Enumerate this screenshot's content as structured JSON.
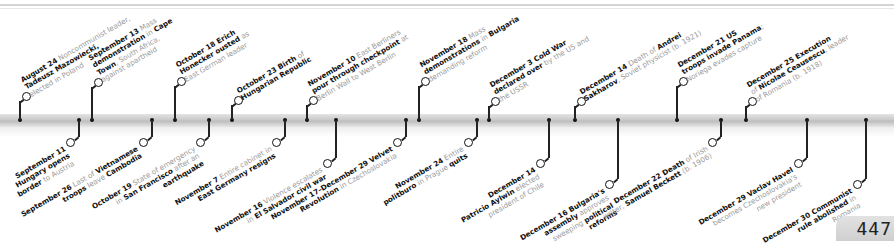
{
  "page": {
    "number": "447"
  },
  "timeline": {
    "above": [
      {
        "x": 20,
        "ringY": 93,
        "date": "August 24",
        "parts": [
          [
            "b",
            "August 24"
          ],
          [
            "t",
            " Noncommunist leader,"
          ],
          [
            "br"
          ],
          [
            "b",
            "Tadeusz Mazowiecki,"
          ],
          [
            "br"
          ],
          [
            "t",
            "elected in Poland"
          ]
        ]
      },
      {
        "x": 92,
        "ringY": 79,
        "date": "September 13",
        "parts": [
          [
            "b",
            "September 13"
          ],
          [
            "t",
            " Mass"
          ],
          [
            "br"
          ],
          [
            "b",
            "demonstration"
          ],
          [
            "t",
            " in "
          ],
          [
            "b",
            "Cape"
          ],
          [
            "br"
          ],
          [
            "b",
            "Town"
          ],
          [
            "t",
            ", South Africa,"
          ],
          [
            "br"
          ],
          [
            "t",
            "against apartheid"
          ]
        ]
      },
      {
        "x": 175,
        "ringY": 78,
        "date": "October 18",
        "parts": [
          [
            "b",
            "October 18 Erich"
          ],
          [
            "br"
          ],
          [
            "b",
            "Honecker ousted"
          ],
          [
            "t",
            " as"
          ],
          [
            "br"
          ],
          [
            "t",
            "East German leader"
          ]
        ]
      },
      {
        "x": 232,
        "ringY": 97,
        "date": "October 23",
        "parts": [
          [
            "b",
            "October 23 Birth"
          ],
          [
            "t",
            " of"
          ],
          [
            "br"
          ],
          [
            "b",
            "Hungarian Republic"
          ]
        ]
      },
      {
        "x": 307,
        "ringY": 97,
        "date": "November 10",
        "parts": [
          [
            "b",
            "November 10"
          ],
          [
            "t",
            " East Berliners"
          ],
          [
            "br"
          ],
          [
            "b",
            "pour through checkpoint"
          ],
          [
            "t",
            " at"
          ],
          [
            "br"
          ],
          [
            "t",
            "Berlin Wall to West Berlin"
          ]
        ]
      },
      {
        "x": 419,
        "ringY": 78,
        "date": "November 18",
        "parts": [
          [
            "b",
            "November 18"
          ],
          [
            "t",
            " Mass"
          ],
          [
            "br"
          ],
          [
            "b",
            "demonstrations"
          ],
          [
            "t",
            " in "
          ],
          [
            "b",
            "Bulgaria"
          ],
          [
            "br"
          ],
          [
            "t",
            "demanding reform"
          ]
        ]
      },
      {
        "x": 489,
        "ringY": 98,
        "date": "December 3",
        "parts": [
          [
            "b",
            "December 3 Cold War"
          ],
          [
            "br"
          ],
          [
            "b",
            "declared over"
          ],
          [
            "t",
            " by the US and"
          ],
          [
            "br"
          ],
          [
            "t",
            "the USSR"
          ]
        ]
      },
      {
        "x": 575,
        "ringY": 98,
        "date": "December 14",
        "parts": [
          [
            "b",
            "December 14"
          ],
          [
            "t",
            " Death of "
          ],
          [
            "b",
            "Andrei"
          ],
          [
            "br"
          ],
          [
            "b",
            "Sakharov"
          ],
          [
            "t",
            ", Soviet physicist (b. 1921)"
          ]
        ]
      },
      {
        "x": 677,
        "ringY": 78,
        "date": "December 21",
        "parts": [
          [
            "b",
            "December 21 US"
          ],
          [
            "br"
          ],
          [
            "b",
            "troops invade Panama"
          ],
          [
            "t",
            ";"
          ],
          [
            "br"
          ],
          [
            "t",
            "Noriega evades capture"
          ]
        ]
      },
      {
        "x": 746,
        "ringY": 98,
        "date": "December 25",
        "parts": [
          [
            "b",
            "December 25 Execution"
          ],
          [
            "br"
          ],
          [
            "t",
            "of "
          ],
          [
            "b",
            "Nicolae Ceausescu"
          ],
          [
            "t",
            ", leader"
          ],
          [
            "br"
          ],
          [
            "t",
            "of Romania (b. 1918)"
          ]
        ]
      }
    ],
    "below": [
      {
        "x": 79,
        "ringY": 139,
        "date": "September 11",
        "parts": [
          [
            "b",
            "September 11"
          ],
          [
            "br"
          ],
          [
            "b",
            "Hungary opens"
          ],
          [
            "br"
          ],
          [
            "b",
            "border"
          ],
          [
            "t",
            " to Austria"
          ]
        ]
      },
      {
        "x": 152,
        "ringY": 139,
        "date": "September 26",
        "parts": [
          [
            "b",
            "September 26"
          ],
          [
            "t",
            " Last of "
          ],
          [
            "b",
            "Vietnamese"
          ],
          [
            "br"
          ],
          [
            "b",
            "troops"
          ],
          [
            "t",
            " leave "
          ],
          [
            "b",
            "Cambodia"
          ]
        ]
      },
      {
        "x": 209,
        "ringY": 139,
        "date": "October 19",
        "parts": [
          [
            "b",
            "October 19"
          ],
          [
            "t",
            " State of emergency"
          ],
          [
            "br"
          ],
          [
            "t",
            "in "
          ],
          [
            "b",
            "San Francisco"
          ],
          [
            "t",
            " after an"
          ],
          [
            "br"
          ],
          [
            "b",
            "earthquake"
          ]
        ]
      },
      {
        "x": 285,
        "ringY": 139,
        "date": "November 7",
        "parts": [
          [
            "b",
            "November 7"
          ],
          [
            "t",
            " Entire cabinet in"
          ],
          [
            "br"
          ],
          [
            "b",
            "East Germany resigns"
          ]
        ]
      },
      {
        "x": 336,
        "ringY": 160,
        "date": "November 16",
        "parts": [
          [
            "b",
            "November 16"
          ],
          [
            "t",
            " Violence escalates"
          ],
          [
            "br"
          ],
          [
            "t",
            "in "
          ],
          [
            "b",
            "El Salvador civil war"
          ]
        ]
      },
      {
        "x": 406,
        "ringY": 139,
        "date": "November 17–December 29",
        "parts": [
          [
            "b",
            "November 17–December 29 Velvet"
          ],
          [
            "br"
          ],
          [
            "b",
            "Revolution"
          ],
          [
            "t",
            " in Czechoslovakia"
          ]
        ]
      },
      {
        "x": 477,
        "ringY": 139,
        "date": "November 24",
        "parts": [
          [
            "b",
            "November 24"
          ],
          [
            "t",
            " Entire"
          ],
          [
            "br"
          ],
          [
            "b",
            "politburo"
          ],
          [
            "t",
            " in Prague "
          ],
          [
            "b",
            "quits"
          ]
        ]
      },
      {
        "x": 549,
        "ringY": 160,
        "date": "December 14",
        "parts": [
          [
            "b",
            "December 14"
          ],
          [
            "br"
          ],
          [
            "b",
            "Patricio Aylwin"
          ],
          [
            "t",
            " elected"
          ],
          [
            "br"
          ],
          [
            "t",
            "president of Chile"
          ]
        ]
      },
      {
        "x": 618,
        "ringY": 181,
        "date": "December 16",
        "parts": [
          [
            "b",
            "December 16 Bulgaria's"
          ],
          [
            "br"
          ],
          [
            "b",
            "assembly"
          ],
          [
            "t",
            " approves"
          ],
          [
            "br"
          ],
          [
            "t",
            "sweeping "
          ],
          [
            "b",
            "political"
          ],
          [
            "br"
          ],
          [
            "b",
            "reforms"
          ]
        ]
      },
      {
        "x": 721,
        "ringY": 139,
        "date": "December 22",
        "parts": [
          [
            "b",
            "December 22 Death"
          ],
          [
            "t",
            " of Irish"
          ],
          [
            "br"
          ],
          [
            "t",
            "writer, "
          ],
          [
            "b",
            "Samuel Beckett"
          ],
          [
            "t",
            " (b. 1906)"
          ]
        ]
      },
      {
        "x": 807,
        "ringY": 160,
        "date": "December 29",
        "parts": [
          [
            "b",
            "December 29 Vaclav Havel"
          ],
          [
            "br"
          ],
          [
            "t",
            "becomes Czechoslovakia's"
          ],
          [
            "br"
          ],
          [
            "t",
            "new president"
          ]
        ]
      },
      {
        "x": 866,
        "ringY": 181,
        "date": "December 30",
        "parts": [
          [
            "b",
            "December 30 Communist"
          ],
          [
            "br"
          ],
          [
            "b",
            "rule abolished"
          ],
          [
            "t",
            " in"
          ],
          [
            "br"
          ],
          [
            "t",
            "Romania"
          ]
        ]
      }
    ]
  }
}
